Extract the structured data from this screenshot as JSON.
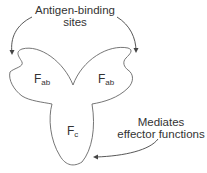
{
  "labels": {
    "antigen_binding_line1": "Antigen-binding",
    "antigen_binding_line2": "sites",
    "effector_line1": "Mediates",
    "effector_line2": "effector functions"
  },
  "fragments": {
    "fab_left": {
      "main": "F",
      "sub": "ab"
    },
    "fab_right": {
      "main": "F",
      "sub": "ab"
    },
    "fc": {
      "main": "F",
      "sub": "c"
    }
  },
  "colors": {
    "outline": "#555555",
    "arrow": "#444444",
    "text": "#333333"
  }
}
